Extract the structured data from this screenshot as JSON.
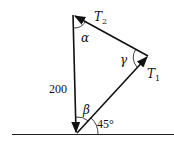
{
  "diagram": {
    "title": "",
    "type": "force triangle",
    "labels": {
      "t2": "T",
      "t2_sub": "2",
      "t1": "T",
      "t1_sub": "1",
      "weight": "200",
      "alpha": "α",
      "beta": "β",
      "gamma": "γ",
      "angle_ground": "45°"
    },
    "vertices": {
      "top": [
        73,
        15
      ],
      "right": [
        148,
        56
      ],
      "bottom": [
        76,
        134
      ]
    },
    "vectors": [
      {
        "name": "200",
        "from": "top",
        "to": "bottom"
      },
      {
        "name": "T1",
        "from": "bottom",
        "to": "right"
      },
      {
        "name": "T2",
        "from": "right",
        "to": "top"
      }
    ],
    "colors": {
      "stroke": "#111111",
      "background": "#ffffff"
    }
  }
}
